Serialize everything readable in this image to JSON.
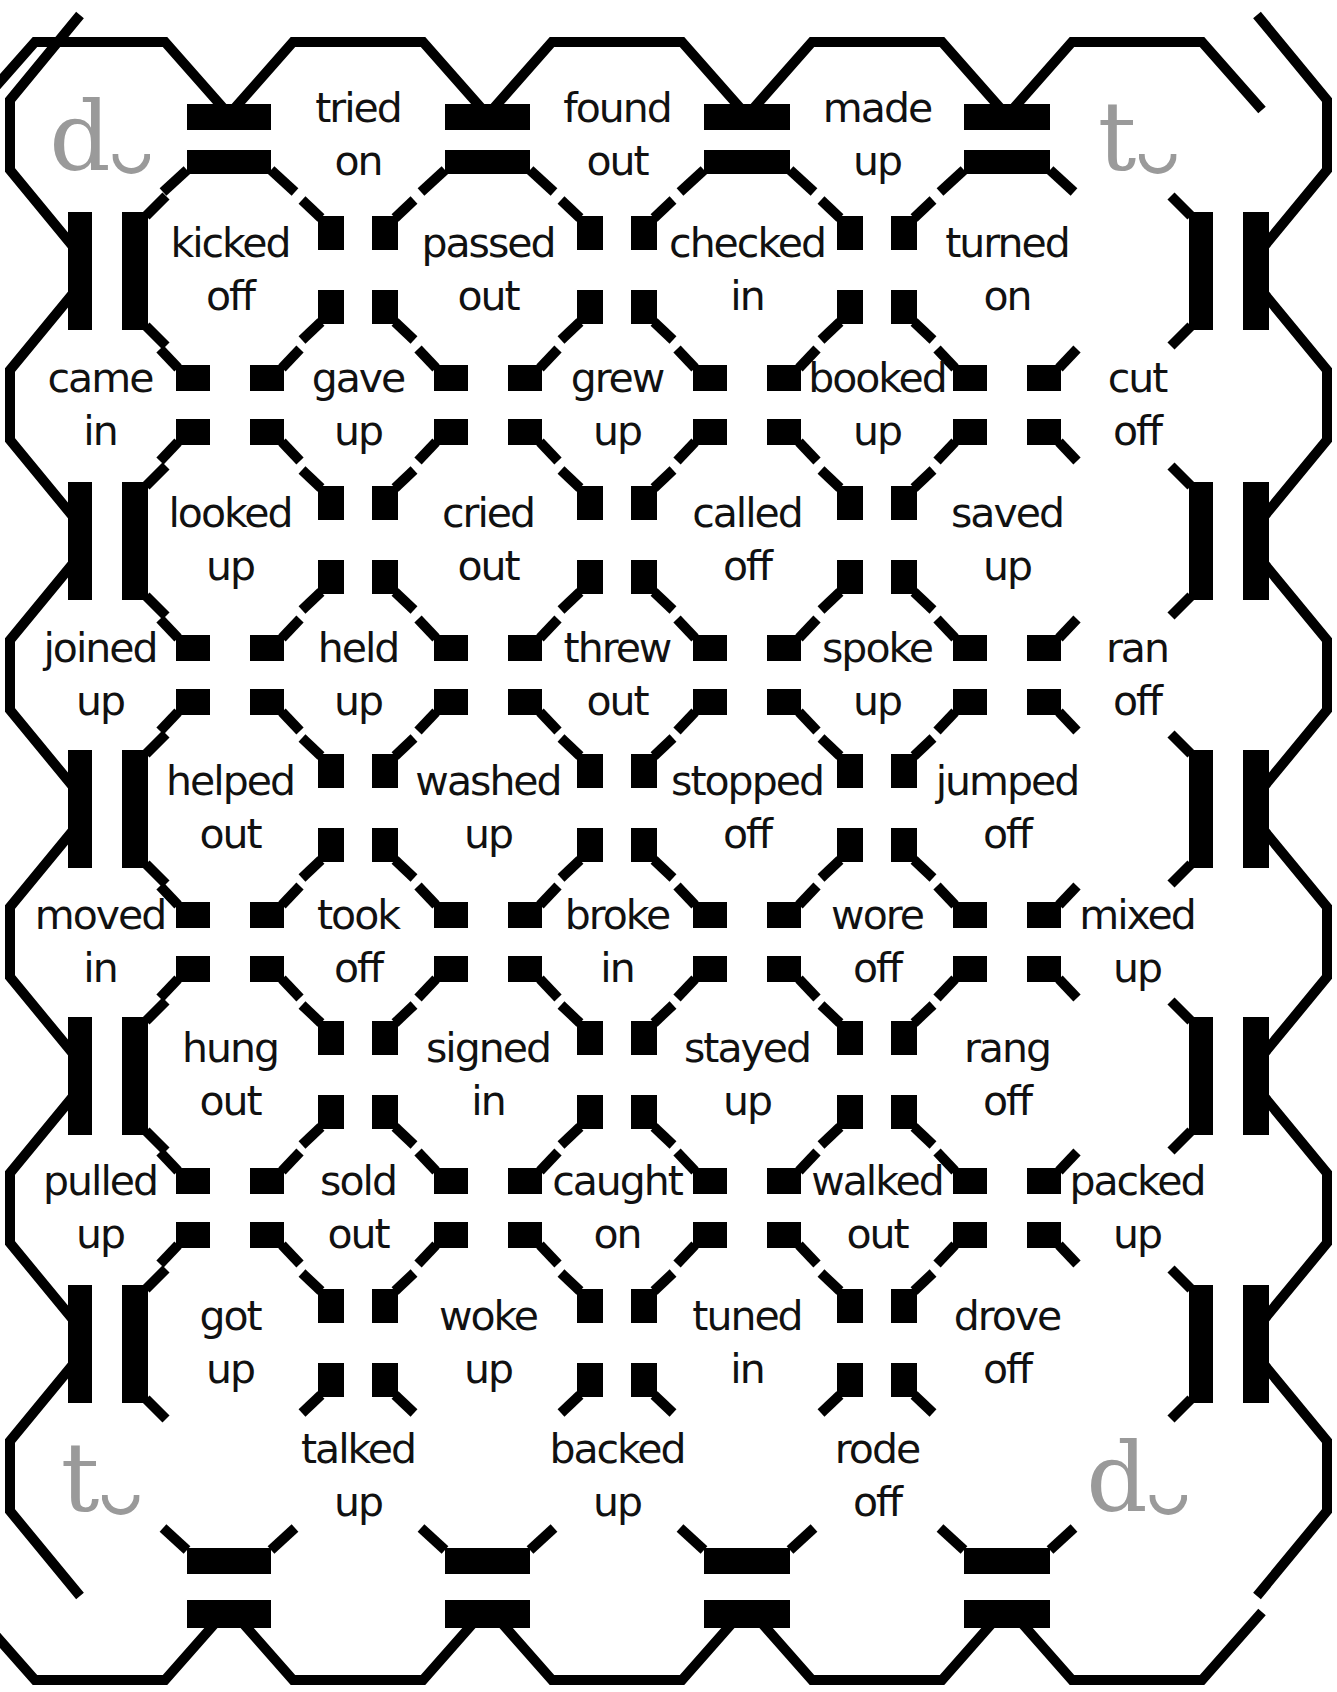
{
  "board": {
    "colors": {
      "line": "#000000",
      "corner_letter": "#9a9a9a",
      "text": "#111111",
      "background": "#ffffff"
    },
    "corners": [
      {
        "position": "top-left",
        "letter": "d"
      },
      {
        "position": "top-right",
        "letter": "t"
      },
      {
        "position": "bottom-left",
        "letter": "t"
      },
      {
        "position": "bottom-right",
        "letter": "d"
      }
    ],
    "rows": [
      {
        "cells": [
          {
            "corner": "d"
          },
          {
            "line1": "tried",
            "line2": "on"
          },
          {
            "line1": "found",
            "line2": "out"
          },
          {
            "line1": "made",
            "line2": "up"
          },
          {
            "corner": "t"
          }
        ]
      },
      {
        "cells": [
          {
            "line1": "kicked",
            "line2": "off"
          },
          {
            "line1": "passed",
            "line2": "out"
          },
          {
            "line1": "checked",
            "line2": "in"
          },
          {
            "line1": "turned",
            "line2": "on"
          }
        ]
      },
      {
        "cells": [
          {
            "line1": "came",
            "line2": "in"
          },
          {
            "line1": "gave",
            "line2": "up"
          },
          {
            "line1": "grew",
            "line2": "up"
          },
          {
            "line1": "booked",
            "line2": "up"
          },
          {
            "line1": "cut",
            "line2": "off"
          }
        ]
      },
      {
        "cells": [
          {
            "line1": "looked",
            "line2": "up"
          },
          {
            "line1": "cried",
            "line2": "out"
          },
          {
            "line1": "called",
            "line2": "off"
          },
          {
            "line1": "saved",
            "line2": "up"
          }
        ]
      },
      {
        "cells": [
          {
            "line1": "joined",
            "line2": "up"
          },
          {
            "line1": "held",
            "line2": "up"
          },
          {
            "line1": "threw",
            "line2": "out"
          },
          {
            "line1": "spoke",
            "line2": "up"
          },
          {
            "line1": "ran",
            "line2": "off"
          }
        ]
      },
      {
        "cells": [
          {
            "line1": "helped",
            "line2": "out"
          },
          {
            "line1": "washed",
            "line2": "up"
          },
          {
            "line1": "stopped",
            "line2": "off"
          },
          {
            "line1": "jumped",
            "line2": "off"
          }
        ]
      },
      {
        "cells": [
          {
            "line1": "moved",
            "line2": "in"
          },
          {
            "line1": "took",
            "line2": "off"
          },
          {
            "line1": "broke",
            "line2": "in"
          },
          {
            "line1": "wore",
            "line2": "off"
          },
          {
            "line1": "mixed",
            "line2": "up"
          }
        ]
      },
      {
        "cells": [
          {
            "line1": "hung",
            "line2": "out"
          },
          {
            "line1": "signed",
            "line2": "in"
          },
          {
            "line1": "stayed",
            "line2": "up"
          },
          {
            "line1": "rang",
            "line2": "off"
          }
        ]
      },
      {
        "cells": [
          {
            "line1": "pulled",
            "line2": "up"
          },
          {
            "line1": "sold",
            "line2": "out"
          },
          {
            "line1": "caught",
            "line2": "on"
          },
          {
            "line1": "walked",
            "line2": "out"
          },
          {
            "line1": "packed",
            "line2": "up"
          }
        ]
      },
      {
        "cells": [
          {
            "line1": "got",
            "line2": "up"
          },
          {
            "line1": "woke",
            "line2": "up"
          },
          {
            "line1": "tuned",
            "line2": "in"
          },
          {
            "line1": "drove",
            "line2": "off"
          }
        ]
      },
      {
        "cells": [
          {
            "corner": "t"
          },
          {
            "line1": "talked",
            "line2": "up"
          },
          {
            "line1": "backed",
            "line2": "up"
          },
          {
            "line1": "rode",
            "line2": "off"
          },
          {
            "corner": "d"
          }
        ]
      }
    ]
  }
}
